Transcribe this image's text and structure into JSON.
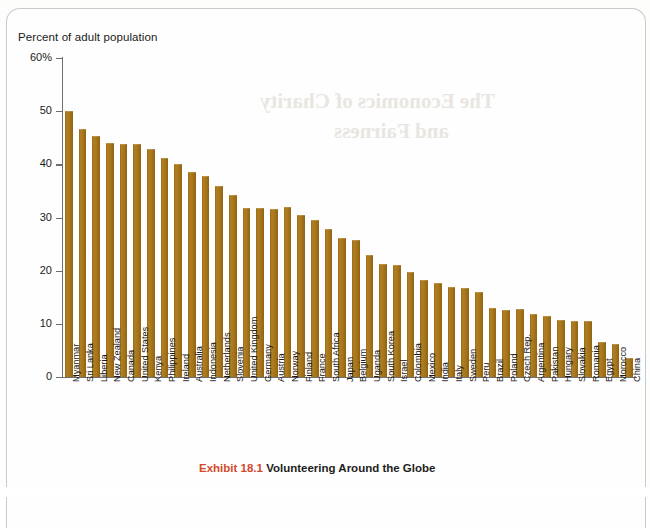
{
  "page": {
    "axis_title": "Percent of adult population",
    "caption_exhibit": "Exhibit 18.1",
    "caption_text": "Volunteering Around the Globe",
    "showthrough_line1": "The Economics of Charity",
    "showthrough_line2": "and Fairness"
  },
  "colors": {
    "bar": "#a9761b",
    "axis": "#6d6e70",
    "caption_accent": "#d2492a",
    "text": "#1a1a1a",
    "page_border": "#c9cacb"
  },
  "chart_data": {
    "type": "bar",
    "title": "Volunteering Around the Globe",
    "xlabel": "",
    "ylabel": "Percent of adult population",
    "ylim": [
      0,
      60
    ],
    "yticks": [
      0,
      10,
      20,
      30,
      40,
      50,
      60
    ],
    "ytick_labels": [
      "0",
      "10",
      "20",
      "30",
      "40",
      "50",
      "60%"
    ],
    "grid": false,
    "legend": false,
    "categories": [
      "Myanmar",
      "Sri Lanka",
      "Liberia",
      "New Zealand",
      "Canada",
      "United States",
      "Kenya",
      "Philippines",
      "Ireland",
      "Australia",
      "Indonesia",
      "Netherlands",
      "Slovenia",
      "United Kingdom",
      "Germany",
      "Austria",
      "Norway",
      "Finland",
      "France",
      "South Africa",
      "Japan",
      "Belgium",
      "Uganda",
      "South Korea",
      "Israel",
      "Colombia",
      "Mexico",
      "India",
      "Italy",
      "Sweden",
      "Peru",
      "Brazil",
      "Poland",
      "Czech Rep.",
      "Argentina",
      "Pakistan",
      "Hungary",
      "Slovakia",
      "Romania",
      "Egypt",
      "Morocco",
      "China"
    ],
    "values": [
      50.0,
      46.7,
      45.4,
      44.0,
      43.9,
      43.8,
      42.9,
      41.2,
      40.0,
      38.6,
      37.8,
      36.0,
      34.2,
      31.7,
      31.7,
      31.6,
      32.0,
      30.5,
      29.5,
      27.8,
      26.1,
      25.8,
      23.0,
      21.2,
      21.0,
      19.8,
      18.3,
      17.7,
      16.9,
      16.8,
      16.0,
      12.9,
      12.6,
      12.7,
      11.8,
      11.5,
      10.7,
      10.5,
      10.5,
      6.6,
      6.2,
      3.5
    ]
  }
}
